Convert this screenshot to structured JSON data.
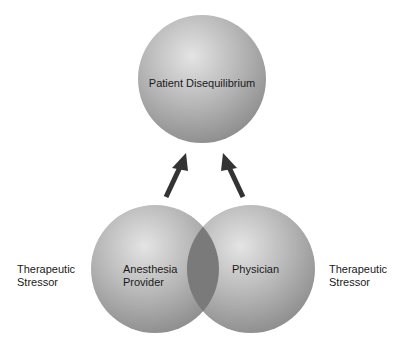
{
  "diagram": {
    "top_node": {
      "label": "Patient Disequilibrium"
    },
    "left_node": {
      "label_line1": "Anesthesia",
      "label_line2": "Provider"
    },
    "right_node": {
      "label": "Physician"
    },
    "left_stressor": {
      "line1": "Therapeutic",
      "line2": "Stressor"
    },
    "right_stressor": {
      "line1": "Therapeutic",
      "line2": "Stressor"
    },
    "colors": {
      "sphere_light": "#e6e6e6",
      "sphere_mid": "#b0b0b0",
      "sphere_dark": "#8c8c8c",
      "overlap": "#7a7a7a",
      "arrow": "#333333"
    }
  }
}
